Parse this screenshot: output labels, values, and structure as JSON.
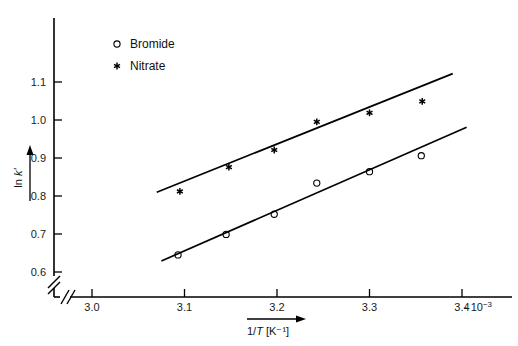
{
  "chart_data": {
    "type": "scatter",
    "title": "",
    "subtitle": "",
    "xlabel": "1/T [K⁻¹]",
    "ylabel": "ln k'",
    "x_multiplier": "· 10⁻³",
    "xlim": [
      2.955,
      3.455
    ],
    "ylim": [
      0.565,
      1.175
    ],
    "xticks": [
      3.0,
      3.1,
      3.2,
      3.3,
      3.4
    ],
    "xticklabels": [
      "3.0",
      "3.1",
      "3.2",
      "3.3",
      "3.4"
    ],
    "yticks": [
      0.6,
      0.7,
      0.8,
      0.9,
      1.0,
      1.1
    ],
    "yticklabels": [
      "0.6",
      "0.7",
      "0.8",
      "0.9",
      "1.0",
      "1.1"
    ],
    "grid": false,
    "axis_break_x": true,
    "axis_break_y": true,
    "legend_position": "top-left-inside",
    "series": [
      {
        "name": "Bromide",
        "marker": "open-circle",
        "color": "#000000",
        "x": [
          3.093,
          3.145,
          3.197,
          3.243,
          3.3,
          3.356
        ],
        "y": [
          0.645,
          0.699,
          0.752,
          0.834,
          0.864,
          0.906
        ],
        "fit_line": {
          "x0": 3.075,
          "y0": 0.629,
          "x1": 3.405,
          "y1": 0.981
        }
      },
      {
        "name": "Nitrate",
        "marker": "asterisk",
        "color": "#000000",
        "x": [
          3.095,
          3.148,
          3.197,
          3.243,
          3.3,
          3.357
        ],
        "y": [
          0.812,
          0.876,
          0.921,
          0.995,
          1.019,
          1.049
        ],
        "fit_line": {
          "x0": 3.07,
          "y0": 0.81,
          "x1": 3.39,
          "y1": 1.122
        }
      }
    ]
  },
  "legend": {
    "items": [
      {
        "label": "Bromide",
        "marker": "open-circle"
      },
      {
        "label": "Nitrate",
        "marker": "asterisk"
      }
    ]
  },
  "axes": {
    "y_title": "ln k'",
    "y_title_prefix": "ln ",
    "y_title_italic": "k'",
    "x_title_prefix": "1/",
    "x_title_italic": "T",
    "x_title_unit": "[K⁻¹]",
    "x_exponent_dot": "·",
    "x_exponent_base": "10",
    "x_exponent_power": "−3"
  }
}
